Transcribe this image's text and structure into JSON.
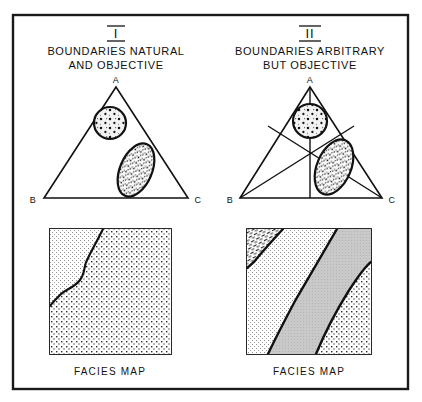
{
  "figure": {
    "frame_color": "#1a1a1a",
    "background": "#ffffff",
    "ink_color": "#111111"
  },
  "panels": [
    {
      "id": "panel-1",
      "roman": "I",
      "heading_line1": "BOUNDARIES  NATURAL",
      "heading_line2": "AND  OBJECTIVE",
      "triangle": {
        "apex_label": "A",
        "left_label": "B",
        "right_label": "C",
        "has_internal_partitions": false,
        "fields": [
          {
            "name": "upper-circle-field",
            "shape": "circle",
            "fill_pattern": "light-stipple-with-dots"
          },
          {
            "name": "lower-ellipse-field",
            "shape": "tilted-ellipse",
            "fill_pattern": "dense-dot-stipple"
          }
        ]
      },
      "map": {
        "caption": "FACIES  MAP",
        "zones": [
          {
            "name": "fine-stipple-zone",
            "pattern": "fine-light-stipple"
          },
          {
            "name": "coarse-dot-zone",
            "pattern": "coarse-dot-stipple"
          }
        ],
        "boundary_style": "irregular-wavy-natural",
        "boundary_count": 1
      }
    },
    {
      "id": "panel-2",
      "roman": "II",
      "heading_line1": "BOUNDARIES  ARBITRARY",
      "heading_line2": "BUT  OBJECTIVE",
      "triangle": {
        "apex_label": "A",
        "left_label": "B",
        "right_label": "C",
        "has_internal_partitions": true,
        "partition_description": "three straight lines from each vertex to a common interior point",
        "fields": [
          {
            "name": "upper-circle-field",
            "shape": "circle",
            "fill_pattern": "light-stipple-with-dots"
          },
          {
            "name": "lower-ellipse-field",
            "shape": "tilted-ellipse",
            "fill_pattern": "dense-dot-stipple"
          }
        ]
      },
      "map": {
        "caption": "FACIES  MAP",
        "zones": [
          {
            "name": "dash-hatch-zone",
            "pattern": "short-dash-hatch"
          },
          {
            "name": "fine-stipple-zone",
            "pattern": "fine-light-stipple"
          },
          {
            "name": "gray-tone-zone",
            "pattern": "flat-gray-tone"
          },
          {
            "name": "coarse-dot-zone",
            "pattern": "coarse-dot-stipple"
          }
        ],
        "boundary_style": "smooth-straight-arbitrary",
        "boundary_count": 3
      }
    }
  ]
}
